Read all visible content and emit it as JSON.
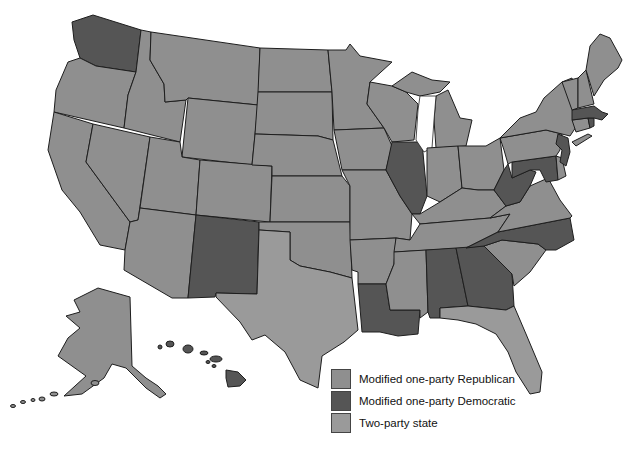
{
  "map": {
    "title": "",
    "colors": {
      "modified_one_party_republican": "#8f8f8f",
      "modified_one_party_democratic": "#555555",
      "two_party_state": "#9a9a9a"
    },
    "states": {
      "modified_one_party_democratic": [
        "WA",
        "NM",
        "IL",
        "WV",
        "MD",
        "NJ",
        "MA",
        "RI",
        "NC",
        "GA",
        "AL",
        "LA",
        "HI"
      ],
      "other_states": [
        "OR",
        "CA",
        "NV",
        "ID",
        "MT",
        "WY",
        "UT",
        "AZ",
        "CO",
        "ND",
        "SD",
        "NE",
        "KS",
        "OK",
        "TX",
        "MN",
        "IA",
        "MO",
        "AR",
        "WI",
        "MI",
        "IN",
        "OH",
        "KY",
        "TN",
        "MS",
        "FL",
        "SC",
        "VA",
        "PA",
        "NY",
        "VT",
        "NH",
        "ME",
        "CT",
        "DE",
        "AK"
      ]
    }
  },
  "legend": {
    "items": [
      {
        "key": "rep",
        "label": "Modified one-party Republican",
        "color": "#8f8f8f"
      },
      {
        "key": "dem",
        "label": "Modified one-party Democratic",
        "color": "#555555"
      },
      {
        "key": "two",
        "label": "Two-party state",
        "color": "#9a9a9a"
      }
    ]
  }
}
